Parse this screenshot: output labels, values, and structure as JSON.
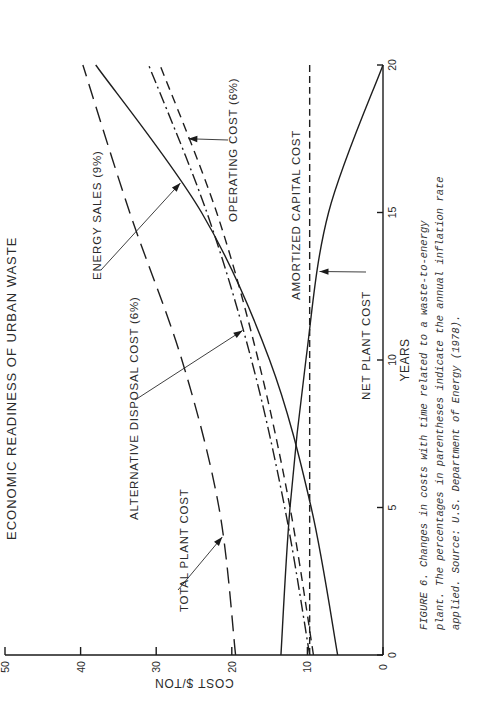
{
  "page": {
    "running_head": "ECONOMIC READINESS OF URBAN WASTE"
  },
  "caption": {
    "lines": [
      "FIGURE 6.  Changes in costs with time related to a waste-to-energy",
      "plant.  The percentages in parentheses indicate the annual inflation rate",
      "applied.  Source:  U.S. Department of Energy (1978)."
    ]
  },
  "chart_data": {
    "type": "line",
    "title": "",
    "xlabel": "YEARS",
    "ylabel": "COST $/TON",
    "xlim": [
      0,
      20
    ],
    "ylim": [
      0,
      50
    ],
    "xticks": [
      0,
      5,
      10,
      15,
      20
    ],
    "xtick_labels": [
      "0",
      "5",
      "10",
      "15",
      "20"
    ],
    "yticks": [
      0,
      10,
      20,
      30,
      40,
      50
    ],
    "ytick_labels": [
      "0",
      "10",
      "20",
      "30",
      "40",
      "50"
    ],
    "grid": false,
    "orientation": "rotated 90 degrees counter-clockwise on the page",
    "x": [
      0,
      5,
      10,
      15,
      20
    ],
    "series": [
      {
        "name": "TOTAL PLANT COST",
        "style": "long-dash",
        "values": [
          19.5,
          21.7,
          26.6,
          33.5,
          39.7
        ]
      },
      {
        "name": "ENERGY SALES (9%)",
        "style": "solid",
        "values": [
          6.0,
          9.5,
          15.0,
          24.0,
          38.0
        ]
      },
      {
        "name": "ALTERNATIVE DISPOSAL COST (6%)",
        "style": "dash-dot",
        "values": [
          9.7,
          13.0,
          17.4,
          23.3,
          31.0
        ]
      },
      {
        "name": "OPERATING COST (6%)",
        "style": "dash",
        "values": [
          9.2,
          12.3,
          16.5,
          22.0,
          29.5
        ]
      },
      {
        "name": "AMORTIZED CAPITAL COST",
        "style": "short-dash",
        "values": [
          9.7,
          9.7,
          9.7,
          9.7,
          9.7
        ]
      },
      {
        "name": "NET PLANT COST",
        "style": "solid",
        "values": [
          13.5,
          12.3,
          10.2,
          7.2,
          0.0
        ]
      }
    ],
    "annotations": [
      {
        "text": "TOTAL PLANT COST",
        "points_to": "TOTAL PLANT COST",
        "at_year": 4
      },
      {
        "text": "ENERGY SALES (9%)",
        "points_to": "ENERGY SALES (9%)",
        "at_year": 16
      },
      {
        "text": "ALTERNATIVE DISPOSAL COST (6%)",
        "points_to": "ALTERNATIVE DISPOSAL COST (6%)",
        "at_year": 11
      },
      {
        "text": "OPERATING COST (6%)",
        "points_to": "OPERATING COST (6%)",
        "at_year": 17.5
      },
      {
        "text": "AMORTIZED CAPITAL COST",
        "points_to": "AMORTIZED CAPITAL COST",
        "at_year": null
      },
      {
        "text": "NET PLANT COST",
        "points_to": "NET PLANT COST",
        "at_year": 13
      }
    ]
  }
}
